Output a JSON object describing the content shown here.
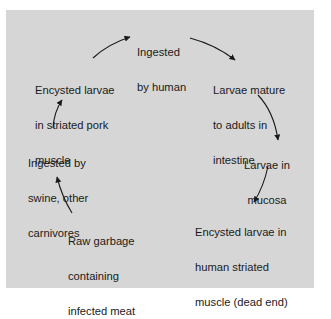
{
  "diagram": {
    "type": "life-cycle",
    "background_color": "#d6d6d6",
    "text_color": "#1a1a1a",
    "nodes": [
      {
        "id": "ingested-by-human",
        "lines": [
          "Ingested",
          "by human"
        ]
      },
      {
        "id": "larvae-mature",
        "lines": [
          "Larvae mature",
          "to adults in",
          "intestine"
        ]
      },
      {
        "id": "larvae-in-mucosa",
        "lines": [
          "Larvae in",
          "mucosa"
        ]
      },
      {
        "id": "encysted-human",
        "lines": [
          "Encysted larvae in",
          "human striated",
          "muscle (dead end)"
        ]
      },
      {
        "id": "raw-garbage",
        "lines": [
          "Raw garbage",
          "containing",
          "infected meat"
        ]
      },
      {
        "id": "ingested-by-swine",
        "lines": [
          "Ingested by",
          "swine, other",
          "carnivores"
        ]
      },
      {
        "id": "encysted-pork",
        "lines": [
          "Encysted larvae",
          "in striated pork",
          "muscle"
        ]
      }
    ],
    "edges": [
      {
        "from": "encysted-pork",
        "to": "ingested-by-human"
      },
      {
        "from": "ingested-by-human",
        "to": "larvae-mature"
      },
      {
        "from": "larvae-mature",
        "to": "larvae-in-mucosa"
      },
      {
        "from": "larvae-in-mucosa",
        "to": "encysted-human"
      },
      {
        "from": "raw-garbage",
        "to": "ingested-by-swine"
      },
      {
        "from": "ingested-by-swine",
        "to": "encysted-pork"
      }
    ]
  }
}
